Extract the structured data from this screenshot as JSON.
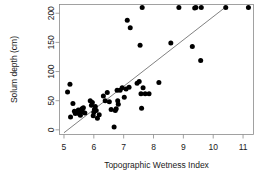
{
  "chart_data": {
    "type": "scatter",
    "title": "",
    "xlabel": "Topographic Wetness Index",
    "ylabel": "Solum depth  (cm)",
    "xlim": [
      4.85,
      11.35
    ],
    "ylim": [
      -8,
      215
    ],
    "xticks": [
      5,
      6,
      7,
      8,
      9,
      10,
      11
    ],
    "xticklabels": [
      "5",
      "6",
      "7",
      "8",
      "9",
      "10",
      "11"
    ],
    "yticks": [
      0,
      50,
      100,
      150,
      200
    ],
    "yticklabels": [
      "0",
      "50",
      "100",
      "150",
      "200"
    ],
    "grid": false,
    "legend": false,
    "marker": "filled-circle",
    "marker_color": "#000000",
    "point_color": "#000000",
    "line_color": "#4a4a4a",
    "frame_color": "#8a8a8a",
    "background": "#ffffff",
    "series": [
      {
        "name": "Observations",
        "x": [
          5.12,
          5.2,
          5.22,
          5.3,
          5.35,
          5.38,
          5.42,
          5.48,
          5.52,
          5.55,
          5.58,
          5.6,
          5.62,
          5.65,
          5.7,
          5.88,
          5.92,
          5.95,
          5.98,
          6.0,
          6.02,
          6.05,
          6.08,
          6.12,
          6.18,
          6.32,
          6.38,
          6.45,
          6.52,
          6.58,
          6.68,
          6.72,
          6.75,
          6.78,
          6.8,
          6.82,
          6.88,
          6.95,
          7.02,
          7.08,
          7.12,
          7.18,
          7.22,
          7.45,
          7.52,
          7.55,
          7.58,
          7.6,
          7.62,
          7.65,
          7.72,
          7.85,
          8.18,
          8.58,
          8.85,
          9.3,
          9.38,
          9.42,
          9.58,
          9.6,
          10.42,
          11.18
        ],
        "y": [
          65,
          78,
          22,
          45,
          32,
          28,
          30,
          34,
          27,
          25,
          33,
          36,
          31,
          38,
          29,
          50,
          42,
          47,
          24,
          30,
          35,
          40,
          33,
          20,
          26,
          58,
          50,
          64,
          48,
          35,
          5,
          33,
          36,
          68,
          50,
          44,
          68,
          72,
          56,
          70,
          188,
          73,
          175,
          80,
          83,
          145,
          62,
          37,
          210,
          72,
          62,
          62,
          81,
          149,
          210,
          143,
          209,
          210,
          119,
          210,
          210,
          210
        ]
      }
    ],
    "fit_line": {
      "name": "regression-line",
      "x0": 5.0,
      "y0": -5,
      "x1": 10.45,
      "y1": 212
    }
  }
}
